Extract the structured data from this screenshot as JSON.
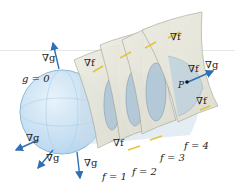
{
  "diagram": {
    "title": "",
    "colors": {
      "sphere_fill": "#cfe5f4",
      "sphere_edge": "#6f9fc6",
      "sheet_fill": "#e8e7dc",
      "sheet_edge": "#9c9a8c",
      "ellipse_fill": "#a9c3d8",
      "grad_g_arrow": "#2f6fb5",
      "grad_f_arrow": "#e4c43a",
      "point": "#111111"
    },
    "sphere": {
      "label": "g = 0"
    },
    "surfaces": [
      {
        "label": "f = 1"
      },
      {
        "label": "f = 2"
      },
      {
        "label": "f = 3"
      },
      {
        "label": "f = 4"
      }
    ],
    "grad_g_labels": [
      "∇g",
      "∇g",
      "∇g",
      "∇g",
      "∇g"
    ],
    "grad_f_labels": [
      "∇f",
      "∇f",
      "∇f",
      "∇f",
      "∇f"
    ],
    "point": {
      "label": "P"
    }
  }
}
